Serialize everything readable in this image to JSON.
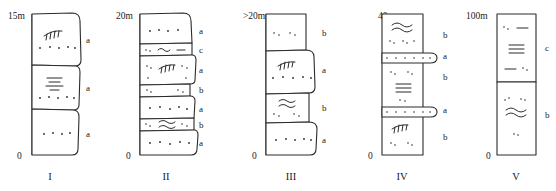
{
  "figure": {
    "datum_label": "0",
    "stroke_color": "#2b2b2b",
    "background_color": "#ffffff"
  },
  "columns": [
    {
      "id": "column-1",
      "roman": "I",
      "scale_label": "15m",
      "zero_label": "0",
      "style": "wavy",
      "facies": [
        "a",
        "a",
        "a"
      ],
      "beds": [
        {
          "facies": "a",
          "symbols": [
            "cross-bedding",
            "dots"
          ]
        },
        {
          "facies": "a",
          "symbols": [
            "horizontal-laminae",
            "dots"
          ]
        },
        {
          "facies": "a",
          "symbols": [
            "dots"
          ]
        }
      ]
    },
    {
      "id": "column-2",
      "roman": "II",
      "scale_label": "20m",
      "zero_label": "0",
      "style": "wavy",
      "facies": [
        "a",
        "c",
        "a",
        "b",
        "a",
        "b",
        "a"
      ],
      "beds": [
        {
          "facies": "a",
          "symbols": [
            "dots"
          ]
        },
        {
          "facies": "c",
          "symbols": [
            "dots",
            "single-wave",
            "dash"
          ]
        },
        {
          "facies": "a",
          "symbols": [
            "dots",
            "cross-bedding"
          ]
        },
        {
          "facies": "b",
          "symbols": [
            "dots"
          ]
        },
        {
          "facies": "a",
          "symbols": [
            "dots"
          ]
        },
        {
          "facies": "b",
          "symbols": [
            "dots",
            "double-wave"
          ]
        },
        {
          "facies": "a",
          "symbols": [
            "dots"
          ]
        }
      ]
    },
    {
      "id": "column-3",
      "roman": "III",
      "scale_label": ">20m",
      "zero_label": "0",
      "style": "wavy",
      "facies": [
        "b",
        "a",
        "b",
        "a"
      ],
      "beds": [
        {
          "facies": "b",
          "symbols": [
            "dots"
          ]
        },
        {
          "facies": "a",
          "symbols": [
            "cross-bedding",
            "dots"
          ]
        },
        {
          "facies": "b",
          "symbols": [
            "double-wave",
            "dots"
          ]
        },
        {
          "facies": "a",
          "symbols": [
            "dots"
          ]
        }
      ]
    },
    {
      "id": "column-4",
      "roman": "IV",
      "scale_label": "40m",
      "zero_label": "0",
      "style": "straight-with-lenses",
      "facies": [
        "b",
        "a",
        "b",
        "a",
        "b"
      ],
      "beds": [
        {
          "facies": "b",
          "symbols": [
            "double-wave",
            "dots"
          ]
        },
        {
          "facies": "a",
          "symbols": [
            "lens",
            "dots"
          ]
        },
        {
          "facies": "b",
          "symbols": [
            "dots",
            "horizontal-laminae",
            "dots"
          ]
        },
        {
          "facies": "a",
          "symbols": [
            "lens",
            "dots"
          ]
        },
        {
          "facies": "b",
          "symbols": [
            "cross-bedding",
            "dots"
          ]
        }
      ]
    },
    {
      "id": "column-5",
      "roman": "V",
      "scale_label": "100m",
      "zero_label": "0",
      "style": "straight",
      "facies": [
        "c",
        "b"
      ],
      "beds": [
        {
          "facies": "c",
          "symbols": [
            "dots",
            "dash",
            "horizontal-laminae",
            "dash",
            "dots"
          ]
        },
        {
          "facies": "b",
          "symbols": [
            "dots",
            "double-wave",
            "dots"
          ]
        }
      ]
    }
  ]
}
